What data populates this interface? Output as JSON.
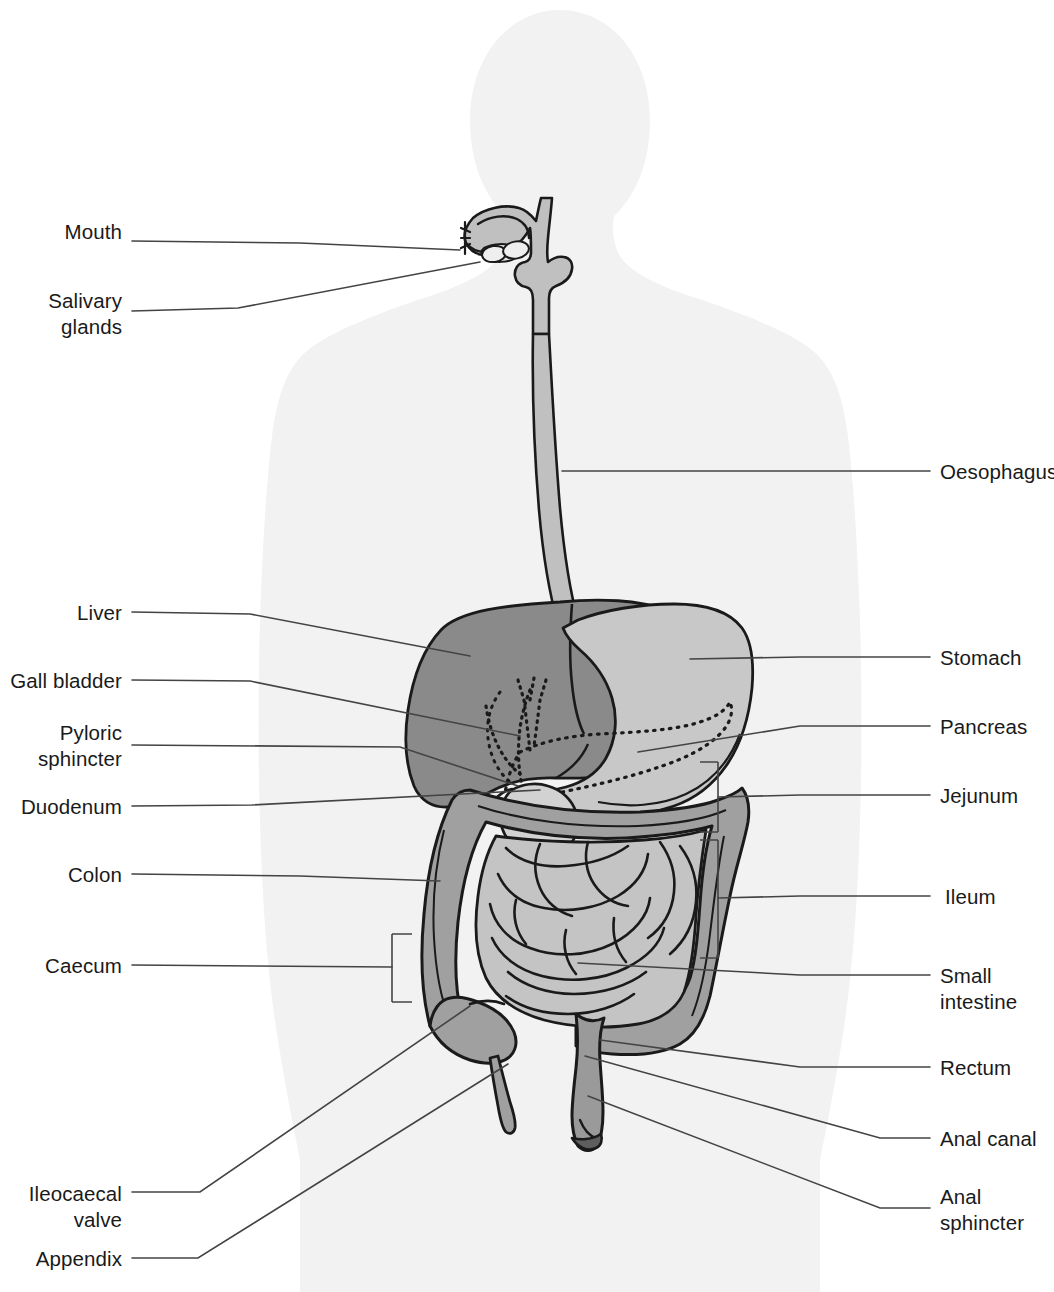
{
  "figure": {
    "type": "labelled anatomical diagram",
    "background_color": "#ffffff",
    "body_silhouette_color": "#f2f2f2"
  },
  "colors": {
    "liver": "#8a8a8a",
    "stomach": "#c8c8c8",
    "colon": "#a0a0a0",
    "small_intestine": "#c4c4c4",
    "oesophagus": "#c0c0c0",
    "rectum": "#9a9a9a",
    "anal_sphincter": "#6a6a6a",
    "outline": "#1a1a1a",
    "leader_line": "#444444",
    "pancreas_outline": "#1a1a1a"
  },
  "labels_left": [
    {
      "id": "mouth",
      "text": "Mouth",
      "x": 58,
      "y": 231,
      "align": "right",
      "anchor_x": 122,
      "lines": 1
    },
    {
      "id": "salivary-glands",
      "text": "Salivary\nglands",
      "x": 44,
      "y": 288,
      "align": "right",
      "anchor_x": 122,
      "lines": 2
    },
    {
      "id": "liver",
      "text": "Liver",
      "x": 70,
      "y": 600,
      "align": "right",
      "anchor_x": 122,
      "lines": 1
    },
    {
      "id": "gall-bladder",
      "text": "Gall bladder",
      "x": 10,
      "y": 668,
      "align": "right",
      "anchor_x": 122,
      "lines": 1
    },
    {
      "id": "pyloric-sphincter",
      "text": "Pyloric\nsphincter",
      "x": 45,
      "y": 731,
      "align": "right",
      "anchor_x": 122,
      "lines": 2
    },
    {
      "id": "duodenum",
      "text": "Duodenum",
      "x": 18,
      "y": 794,
      "align": "right",
      "anchor_x": 122,
      "lines": 1
    },
    {
      "id": "colon",
      "text": "Colon",
      "x": 65,
      "y": 862,
      "align": "right",
      "anchor_x": 122,
      "lines": 1
    },
    {
      "id": "caecum",
      "text": "Caecum",
      "x": 45,
      "y": 952,
      "align": "right",
      "anchor_x": 122,
      "lines": 1
    },
    {
      "id": "ileocaecal-valve",
      "text": "Ileocaecal\nvalve",
      "x": 34,
      "y": 1180,
      "align": "right",
      "anchor_x": 122,
      "lines": 2
    },
    {
      "id": "appendix",
      "text": "Appendix",
      "x": 35,
      "y": 1247,
      "align": "right",
      "anchor_x": 122,
      "lines": 1
    }
  ],
  "labels_right": [
    {
      "id": "oesophagus",
      "text": "Oesophagus",
      "x": 940,
      "y": 461,
      "align": "left",
      "anchor_x": 930,
      "lines": 1
    },
    {
      "id": "stomach",
      "text": "Stomach",
      "x": 940,
      "y": 645,
      "align": "left",
      "anchor_x": 930,
      "lines": 1
    },
    {
      "id": "pancreas",
      "text": "Pancreas",
      "x": 940,
      "y": 714,
      "align": "left",
      "anchor_x": 930,
      "lines": 1
    },
    {
      "id": "jejunum",
      "text": "Jejunum",
      "x": 940,
      "y": 783,
      "align": "left",
      "anchor_x": 930,
      "lines": 1
    },
    {
      "id": "ileum",
      "text": "Ileum",
      "x": 945,
      "y": 884,
      "align": "left",
      "anchor_x": 930,
      "lines": 1
    },
    {
      "id": "small-intestine",
      "text": "Small\nintestine",
      "x": 940,
      "y": 987,
      "align": "left",
      "anchor_x": 930,
      "lines": 2
    },
    {
      "id": "rectum",
      "text": "Rectum",
      "x": 940,
      "y": 1055,
      "align": "left",
      "anchor_x": 930,
      "lines": 1
    },
    {
      "id": "anal-canal",
      "text": "Anal canal",
      "x": 940,
      "y": 1126,
      "align": "left",
      "anchor_x": 930,
      "lines": 1
    },
    {
      "id": "anal-sphincter",
      "text": "Anal\nsphincter",
      "x": 940,
      "y": 1196,
      "align": "left",
      "anchor_x": 930,
      "lines": 2
    }
  ],
  "organs": [
    {
      "id": "mouth-cavity",
      "name": "Mouth / oral cavity"
    },
    {
      "id": "salivary-glands",
      "name": "Salivary glands"
    },
    {
      "id": "oesophagus",
      "name": "Oesophagus"
    },
    {
      "id": "liver",
      "name": "Liver"
    },
    {
      "id": "gall-bladder",
      "name": "Gall bladder"
    },
    {
      "id": "stomach",
      "name": "Stomach"
    },
    {
      "id": "pancreas",
      "name": "Pancreas"
    },
    {
      "id": "duodenum",
      "name": "Duodenum"
    },
    {
      "id": "pyloric-sphincter",
      "name": "Pyloric sphincter"
    },
    {
      "id": "small-intestine",
      "name": "Small intestine (jejunum + ileum)"
    },
    {
      "id": "colon",
      "name": "Colon"
    },
    {
      "id": "caecum",
      "name": "Caecum"
    },
    {
      "id": "appendix",
      "name": "Appendix"
    },
    {
      "id": "ileocaecal-valve",
      "name": "Ileocaecal valve"
    },
    {
      "id": "rectum",
      "name": "Rectum"
    },
    {
      "id": "anal-canal",
      "name": "Anal canal"
    },
    {
      "id": "anal-sphincter",
      "name": "Anal sphincter"
    }
  ],
  "brackets": [
    {
      "id": "jejunum-bracket",
      "side": "right",
      "x": 718,
      "y_top": 762,
      "y_bottom": 832
    },
    {
      "id": "ileum-bracket",
      "side": "right",
      "x": 718,
      "y_top": 840,
      "y_bottom": 958
    },
    {
      "id": "caecum-bracket",
      "side": "left",
      "x": 392,
      "y_top": 934,
      "y_bottom": 1002
    }
  ]
}
